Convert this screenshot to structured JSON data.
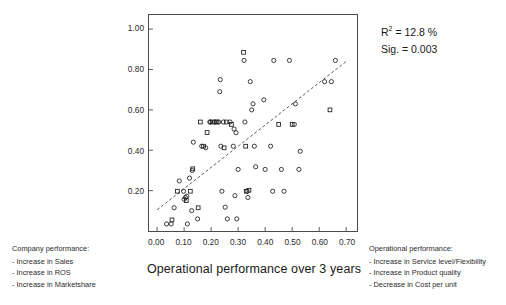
{
  "chart_data": {
    "type": "scatter",
    "title": "",
    "xlabel": "Operational performance over 3 years",
    "ylabel": "Company performance over 3 years",
    "xlim": [
      -0.03,
      0.74
    ],
    "ylim": [
      0.0,
      1.07
    ],
    "grid": false,
    "legend_position": "none",
    "xticks": [
      "0.00",
      "0.10",
      "0.20",
      "0.30",
      "0.40",
      "0.50",
      "0.60",
      "0.70"
    ],
    "xtick_values": [
      0.0,
      0.1,
      0.2,
      0.3,
      0.4,
      0.5,
      0.6,
      0.7
    ],
    "yticks": [
      "0.20",
      "0.40",
      "0.60",
      "0.80",
      "1.00"
    ],
    "ytick_values": [
      0.2,
      0.4,
      0.6,
      0.8,
      1.0
    ],
    "marker_color": "#1a1a1a",
    "line_color": "#333333",
    "line_style": "dashed",
    "regression_line": {
      "x0": 0.0,
      "y0": 0.105,
      "x1": 0.705,
      "y1": 0.845
    },
    "annotations": [
      {
        "text": "R2 = 12.8 %",
        "value": "12.8 %",
        "label": "R squared"
      },
      {
        "text": "Sig. = 0.003",
        "value": "0.003",
        "label": "Significance"
      }
    ],
    "points": [
      {
        "x": 0.035,
        "y": 0.035,
        "m": "c"
      },
      {
        "x": 0.055,
        "y": 0.055,
        "m": "s"
      },
      {
        "x": 0.052,
        "y": 0.035,
        "m": "c"
      },
      {
        "x": 0.063,
        "y": 0.115,
        "m": "c"
      },
      {
        "x": 0.075,
        "y": 0.197,
        "m": "s"
      },
      {
        "x": 0.082,
        "y": 0.248,
        "m": "c"
      },
      {
        "x": 0.098,
        "y": 0.197,
        "m": "c"
      },
      {
        "x": 0.1,
        "y": 0.157,
        "m": "c"
      },
      {
        "x": 0.105,
        "y": 0.166,
        "m": "c"
      },
      {
        "x": 0.108,
        "y": 0.151,
        "m": "s"
      },
      {
        "x": 0.11,
        "y": 0.172,
        "m": "c"
      },
      {
        "x": 0.112,
        "y": 0.035,
        "m": "c"
      },
      {
        "x": 0.12,
        "y": 0.262,
        "m": "c"
      },
      {
        "x": 0.123,
        "y": 0.197,
        "m": "s"
      },
      {
        "x": 0.128,
        "y": 0.101,
        "m": "c"
      },
      {
        "x": 0.13,
        "y": 0.3,
        "m": "c"
      },
      {
        "x": 0.132,
        "y": 0.308,
        "m": "s"
      },
      {
        "x": 0.134,
        "y": 0.44,
        "m": "c"
      },
      {
        "x": 0.15,
        "y": 0.06,
        "m": "c"
      },
      {
        "x": 0.152,
        "y": 0.115,
        "m": "s"
      },
      {
        "x": 0.16,
        "y": 0.54,
        "m": "s"
      },
      {
        "x": 0.165,
        "y": 0.42,
        "m": "c"
      },
      {
        "x": 0.172,
        "y": 0.42,
        "m": "s"
      },
      {
        "x": 0.18,
        "y": 0.412,
        "m": "c"
      },
      {
        "x": 0.185,
        "y": 0.488,
        "m": "s"
      },
      {
        "x": 0.195,
        "y": 0.54,
        "m": "c"
      },
      {
        "x": 0.198,
        "y": 0.54,
        "m": "c"
      },
      {
        "x": 0.205,
        "y": 0.54,
        "m": "s"
      },
      {
        "x": 0.212,
        "y": 0.54,
        "m": "c"
      },
      {
        "x": 0.218,
        "y": 0.54,
        "m": "c"
      },
      {
        "x": 0.222,
        "y": 0.54,
        "m": "s"
      },
      {
        "x": 0.228,
        "y": 0.54,
        "m": "c"
      },
      {
        "x": 0.232,
        "y": 0.69,
        "m": "c"
      },
      {
        "x": 0.234,
        "y": 0.75,
        "m": "c"
      },
      {
        "x": 0.236,
        "y": 0.42,
        "m": "c"
      },
      {
        "x": 0.24,
        "y": 0.197,
        "m": "c"
      },
      {
        "x": 0.245,
        "y": 0.54,
        "m": "c"
      },
      {
        "x": 0.248,
        "y": 0.412,
        "m": "s"
      },
      {
        "x": 0.252,
        "y": 0.118,
        "m": "c"
      },
      {
        "x": 0.256,
        "y": 0.54,
        "m": "s"
      },
      {
        "x": 0.26,
        "y": 0.06,
        "m": "c"
      },
      {
        "x": 0.27,
        "y": 0.54,
        "m": "c"
      },
      {
        "x": 0.275,
        "y": 0.528,
        "m": "s"
      },
      {
        "x": 0.282,
        "y": 0.42,
        "m": "c"
      },
      {
        "x": 0.285,
        "y": 0.505,
        "m": "c"
      },
      {
        "x": 0.288,
        "y": 0.175,
        "m": "c"
      },
      {
        "x": 0.292,
        "y": 0.487,
        "m": "c"
      },
      {
        "x": 0.295,
        "y": 0.06,
        "m": "c"
      },
      {
        "x": 0.3,
        "y": 0.305,
        "m": "c"
      },
      {
        "x": 0.32,
        "y": 0.885,
        "m": "s"
      },
      {
        "x": 0.322,
        "y": 0.845,
        "m": "c"
      },
      {
        "x": 0.325,
        "y": 0.54,
        "m": "c"
      },
      {
        "x": 0.328,
        "y": 0.42,
        "m": "s"
      },
      {
        "x": 0.33,
        "y": 0.197,
        "m": "s"
      },
      {
        "x": 0.333,
        "y": 0.197,
        "m": "c"
      },
      {
        "x": 0.336,
        "y": 0.166,
        "m": "c"
      },
      {
        "x": 0.34,
        "y": 0.202,
        "m": "s"
      },
      {
        "x": 0.345,
        "y": 0.74,
        "m": "c"
      },
      {
        "x": 0.35,
        "y": 0.6,
        "m": "c"
      },
      {
        "x": 0.355,
        "y": 0.63,
        "m": "c"
      },
      {
        "x": 0.36,
        "y": 0.42,
        "m": "c"
      },
      {
        "x": 0.365,
        "y": 0.318,
        "m": "c"
      },
      {
        "x": 0.395,
        "y": 0.65,
        "m": "c"
      },
      {
        "x": 0.4,
        "y": 0.305,
        "m": "c"
      },
      {
        "x": 0.42,
        "y": 0.42,
        "m": "c"
      },
      {
        "x": 0.428,
        "y": 0.197,
        "m": "c"
      },
      {
        "x": 0.432,
        "y": 0.845,
        "m": "c"
      },
      {
        "x": 0.45,
        "y": 0.528,
        "m": "s"
      },
      {
        "x": 0.46,
        "y": 0.305,
        "m": "c"
      },
      {
        "x": 0.47,
        "y": 0.197,
        "m": "c"
      },
      {
        "x": 0.49,
        "y": 0.845,
        "m": "c"
      },
      {
        "x": 0.5,
        "y": 0.528,
        "m": "s"
      },
      {
        "x": 0.508,
        "y": 0.528,
        "m": "c"
      },
      {
        "x": 0.512,
        "y": 0.63,
        "m": "c"
      },
      {
        "x": 0.525,
        "y": 0.305,
        "m": "c"
      },
      {
        "x": 0.53,
        "y": 0.395,
        "m": "c"
      },
      {
        "x": 0.62,
        "y": 0.74,
        "m": "c"
      },
      {
        "x": 0.64,
        "y": 0.6,
        "m": "s"
      },
      {
        "x": 0.645,
        "y": 0.74,
        "m": "c"
      },
      {
        "x": 0.66,
        "y": 0.845,
        "m": "c"
      }
    ]
  },
  "stats": {
    "r_squared_label": "R",
    "r_squared_sup": "2",
    "r_squared_eq": " = 12.8 %",
    "sig_text": "Sig. = 0.003"
  },
  "legend_company": {
    "title": "Company performance:",
    "items": [
      "- Increase in Sales",
      "- Increase in ROS",
      "- Increase in Marketshare"
    ]
  },
  "legend_operational": {
    "title": "Operational performance:",
    "items": [
      "- Increase in Service level/Flexibility",
      "- Increase in Product quality",
      "- Decrease in Cost per unit"
    ]
  }
}
